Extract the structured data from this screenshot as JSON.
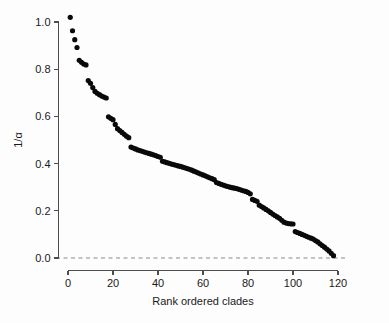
{
  "chart_data": {
    "type": "scatter",
    "title": "",
    "xlabel": "Rank ordered clades",
    "ylabel": "1/α",
    "xlim": [
      0,
      120
    ],
    "ylim": [
      0.0,
      1.05
    ],
    "grid": false,
    "legend": null,
    "xticks": [
      "0",
      "20",
      "40",
      "60",
      "80",
      "100",
      "120"
    ],
    "xtick_values": [
      0,
      20,
      40,
      60,
      80,
      100,
      120
    ],
    "yticks": [
      "0.0",
      "0.2",
      "0.4",
      "0.6",
      "0.8",
      "1.0"
    ],
    "ytick_values": [
      0.0,
      0.2,
      0.4,
      0.6,
      0.8,
      1.0
    ],
    "annotations": [
      {
        "name": "zero-reference-line",
        "type": "hline",
        "y": 0.0,
        "style": "dashed",
        "color": "#8a8a8a"
      }
    ],
    "marker": {
      "shape": "circle",
      "color": "#0a0a0a",
      "size": 2.6
    },
    "series": [
      {
        "name": "1/alpha by rank",
        "x": [
          1,
          2,
          3,
          4,
          5,
          6,
          7,
          8,
          9,
          10,
          11,
          12,
          13,
          14,
          15,
          16,
          17,
          18,
          19,
          20,
          21,
          22,
          23,
          24,
          25,
          26,
          27,
          28,
          29,
          30,
          31,
          32,
          33,
          34,
          35,
          36,
          37,
          38,
          39,
          40,
          41,
          42,
          43,
          44,
          45,
          46,
          47,
          48,
          49,
          50,
          51,
          52,
          53,
          54,
          55,
          56,
          57,
          58,
          59,
          60,
          61,
          62,
          63,
          64,
          65,
          66,
          67,
          68,
          69,
          70,
          71,
          72,
          73,
          74,
          75,
          76,
          77,
          78,
          79,
          80,
          81,
          82,
          83,
          84,
          85,
          86,
          87,
          88,
          89,
          90,
          91,
          92,
          93,
          94,
          95,
          96,
          97,
          98,
          99,
          100,
          101,
          102,
          103,
          104,
          105,
          106,
          107,
          108,
          109,
          110,
          111,
          112,
          113,
          114,
          115,
          116,
          117,
          118
        ],
        "y": [
          1.02,
          0.963,
          0.925,
          0.892,
          0.838,
          0.829,
          0.822,
          0.818,
          0.752,
          0.74,
          0.722,
          0.706,
          0.698,
          0.692,
          0.686,
          0.682,
          0.678,
          0.598,
          0.592,
          0.586,
          0.566,
          0.548,
          0.54,
          0.532,
          0.524,
          0.516,
          0.51,
          0.47,
          0.466,
          0.462,
          0.458,
          0.455,
          0.452,
          0.449,
          0.446,
          0.443,
          0.44,
          0.437,
          0.434,
          0.43,
          0.427,
          0.41,
          0.407,
          0.404,
          0.401,
          0.398,
          0.396,
          0.393,
          0.39,
          0.388,
          0.385,
          0.382,
          0.379,
          0.376,
          0.372,
          0.368,
          0.364,
          0.36,
          0.356,
          0.352,
          0.348,
          0.344,
          0.34,
          0.336,
          0.332,
          0.32,
          0.316,
          0.312,
          0.309,
          0.306,
          0.303,
          0.3,
          0.298,
          0.296,
          0.294,
          0.291,
          0.288,
          0.285,
          0.282,
          0.278,
          0.272,
          0.248,
          0.244,
          0.24,
          0.224,
          0.218,
          0.212,
          0.206,
          0.2,
          0.193,
          0.186,
          0.18,
          0.174,
          0.168,
          0.16,
          0.152,
          0.148,
          0.146,
          0.145,
          0.144,
          0.112,
          0.108,
          0.104,
          0.1,
          0.096,
          0.092,
          0.088,
          0.084,
          0.08,
          0.074,
          0.068,
          0.06,
          0.053,
          0.046,
          0.038,
          0.03,
          0.02,
          0.01
        ]
      }
    ]
  }
}
